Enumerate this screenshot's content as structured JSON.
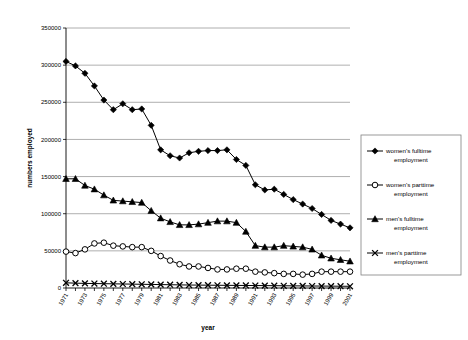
{
  "chart_data": {
    "type": "line",
    "title": "",
    "xlabel": "year",
    "ylabel": "numbers employed",
    "ylim": [
      0,
      350000
    ],
    "ytick_labels": [
      "0",
      "50000",
      "100000",
      "150000",
      "200000",
      "250000",
      "300000",
      "350000"
    ],
    "ytick_values": [
      0,
      50000,
      100000,
      150000,
      200000,
      250000,
      300000,
      350000
    ],
    "grid": true,
    "legend_position": "right",
    "x": [
      1971,
      1972,
      1973,
      1974,
      1975,
      1976,
      1977,
      1978,
      1979,
      1980,
      1981,
      1982,
      1983,
      1984,
      1985,
      1986,
      1987,
      1988,
      1989,
      1990,
      1991,
      1992,
      1993,
      1994,
      1995,
      1996,
      1997,
      1998,
      1999,
      2000,
      2001
    ],
    "xtick_labels": [
      "1971",
      "1973",
      "1975",
      "1977",
      "1979",
      "1981",
      "1983",
      "1985",
      "1987",
      "1989",
      "1991",
      "1993",
      "1995",
      "1997",
      "1999",
      "2001"
    ],
    "series": [
      {
        "name": "women's fulltime employment",
        "marker": "diamond-filled",
        "values": [
          305000,
          299000,
          289000,
          272000,
          253000,
          240000,
          248000,
          240000,
          241000,
          219000,
          186000,
          178000,
          175000,
          182000,
          184000,
          185000,
          185000,
          186000,
          173000,
          165000,
          139000,
          132000,
          133000,
          126000,
          119000,
          113000,
          107000,
          99000,
          91000,
          86000,
          81000
        ]
      },
      {
        "name": "women's parttime employment",
        "marker": "circle-open",
        "values": [
          49000,
          47000,
          52000,
          60000,
          61000,
          57000,
          56000,
          55000,
          55000,
          50000,
          43000,
          37000,
          32000,
          29000,
          29000,
          27000,
          25000,
          25000,
          26000,
          26000,
          22000,
          21000,
          20000,
          19000,
          19000,
          18000,
          19000,
          22000,
          22000,
          22000,
          22000
        ]
      },
      {
        "name": "men's fulltime employment",
        "marker": "triangle-filled",
        "values": [
          147000,
          147000,
          138000,
          133000,
          125000,
          118000,
          117000,
          116000,
          115000,
          104000,
          94000,
          89000,
          85000,
          85000,
          86000,
          88000,
          90000,
          90000,
          88000,
          76000,
          57000,
          55000,
          55000,
          57000,
          56000,
          55000,
          52000,
          44000,
          40000,
          38000,
          36000
        ]
      },
      {
        "name": "men's parttime employment",
        "marker": "cross-x",
        "values": [
          7000,
          6500,
          6200,
          6000,
          5800,
          5600,
          5400,
          5200,
          5000,
          4800,
          4600,
          4400,
          4200,
          4000,
          3900,
          3800,
          3700,
          3600,
          3500,
          3400,
          3300,
          3200,
          3100,
          3000,
          2900,
          2800,
          2700,
          2600,
          2500,
          2400,
          2300
        ]
      }
    ]
  },
  "legend": {
    "items": [
      {
        "label_line1": "women's fulltime",
        "label_line2": "employment",
        "marker": "diamond-filled"
      },
      {
        "label_line1": "women's parttime",
        "label_line2": "employment",
        "marker": "circle-open"
      },
      {
        "label_line1": "men's fulltime",
        "label_line2": "employment",
        "marker": "triangle-filled"
      },
      {
        "label_line1": "men's parttime",
        "label_line2": "employment",
        "marker": "cross-x"
      }
    ]
  },
  "colors": {
    "ink": "#000000",
    "grid": "#9a9a9a",
    "legend_border": "#808080",
    "background": "#ffffff"
  }
}
